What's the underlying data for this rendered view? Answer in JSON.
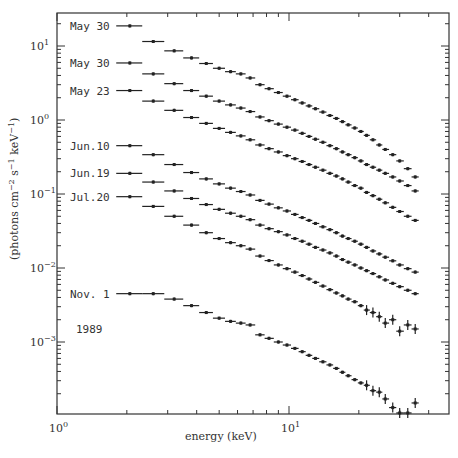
{
  "chart_data": {
    "type": "scatter",
    "title": "",
    "xlabel": "energy (keV)",
    "ylabel": "(photons cm-2 s-1 keV-1)",
    "xscale": "log",
    "yscale": "log",
    "xlim": [
      1,
      48
    ],
    "ylim": [
      0.0001,
      28
    ],
    "x_tick_labels": [
      "10^0",
      "10^1"
    ],
    "y_tick_labels": [
      "10^1",
      "10^0",
      "10^-1",
      "10^-2",
      "10^-3"
    ],
    "grid": false,
    "legend_position": "inline-left",
    "annotation": "1989",
    "energies": [
      2.06,
      2.6,
      3.2,
      3.8,
      4.4,
      5.0,
      5.6,
      6.2,
      6.8,
      7.5,
      8.2,
      9.0,
      9.8,
      10.6,
      11.4,
      12.2,
      13.0,
      14.0,
      15.0,
      16.0,
      17.0,
      18.0,
      19.2,
      20.4,
      21.6,
      23.0,
      24.5,
      26.0,
      28.0,
      30.0,
      32.5,
      35.0
    ],
    "series": [
      {
        "name": "May 30",
        "values": [
          18.7,
          11.5,
          8.6,
          6.9,
          5.8,
          5.0,
          4.5,
          4.2,
          3.7,
          3.0,
          2.65,
          2.35,
          2.1,
          1.88,
          1.7,
          1.55,
          1.42,
          1.28,
          1.15,
          1.05,
          0.95,
          0.86,
          0.78,
          0.7,
          0.62,
          0.54,
          0.46,
          0.4,
          0.34,
          0.28,
          0.22,
          0.17
        ]
      },
      {
        "name": "May 30",
        "values": [
          5.9,
          4.2,
          3.1,
          2.5,
          2.1,
          1.8,
          1.6,
          1.45,
          1.3,
          1.1,
          0.98,
          0.88,
          0.8,
          0.73,
          0.66,
          0.6,
          0.55,
          0.5,
          0.45,
          0.41,
          0.37,
          0.34,
          0.31,
          0.28,
          0.25,
          0.23,
          0.21,
          0.19,
          0.17,
          0.15,
          0.13,
          0.11
        ]
      },
      {
        "name": "May 23",
        "values": [
          2.5,
          1.8,
          1.35,
          1.08,
          0.9,
          0.77,
          0.68,
          0.61,
          0.54,
          0.46,
          0.41,
          0.37,
          0.33,
          0.3,
          0.275,
          0.25,
          0.23,
          0.21,
          0.19,
          0.175,
          0.16,
          0.145,
          0.13,
          0.12,
          0.105,
          0.095,
          0.085,
          0.076,
          0.066,
          0.058,
          0.05,
          0.044
        ]
      },
      {
        "name": "Jun.10",
        "values": [
          0.45,
          0.34,
          0.25,
          0.195,
          0.16,
          0.137,
          0.12,
          0.108,
          0.097,
          0.082,
          0.073,
          0.065,
          0.059,
          0.053,
          0.048,
          0.044,
          0.04,
          0.036,
          0.033,
          0.03,
          0.027,
          0.025,
          0.023,
          0.021,
          0.019,
          0.017,
          0.0155,
          0.014,
          0.0125,
          0.011,
          0.0098,
          0.0088
        ]
      },
      {
        "name": "Jun.19",
        "values": [
          0.19,
          0.145,
          0.11,
          0.087,
          0.072,
          0.062,
          0.055,
          0.05,
          0.045,
          0.038,
          0.034,
          0.031,
          0.028,
          0.025,
          0.023,
          0.021,
          0.019,
          0.0175,
          0.016,
          0.0145,
          0.013,
          0.012,
          0.011,
          0.01,
          0.0092,
          0.0084,
          0.0076,
          0.0069,
          0.0062,
          0.0056,
          0.005,
          0.0045
        ]
      },
      {
        "name": "Jul.20",
        "values": [
          0.092,
          0.068,
          0.05,
          0.038,
          0.03,
          0.025,
          0.022,
          0.02,
          0.018,
          0.0145,
          0.0126,
          0.011,
          0.0098,
          0.0088,
          0.0079,
          0.0071,
          0.0064,
          0.0057,
          0.0051,
          0.0046,
          0.0042,
          0.0038,
          0.0035,
          0.0031,
          0.0027,
          0.0025,
          0.0022,
          0.0018,
          0.002,
          0.0014,
          0.0017,
          0.0015
        ]
      },
      {
        "name": "Nov. 1",
        "values": [
          0.0045,
          0.0045,
          0.0038,
          0.0031,
          0.0025,
          0.0021,
          0.0019,
          0.0018,
          0.0017,
          0.00125,
          0.00112,
          0.001,
          0.00091,
          0.00082,
          0.00074,
          0.00066,
          0.0006,
          0.00054,
          0.00049,
          0.00044,
          0.00039,
          0.00035,
          0.00031,
          0.00028,
          0.00026,
          0.00022,
          0.00021,
          0.00017,
          0.00013,
          0.00011,
          0.00011,
          0.00015
        ]
      }
    ],
    "legend_label_y": [
      18.7,
      5.9,
      2.5,
      0.45,
      0.19,
      0.092,
      0.0045
    ]
  }
}
